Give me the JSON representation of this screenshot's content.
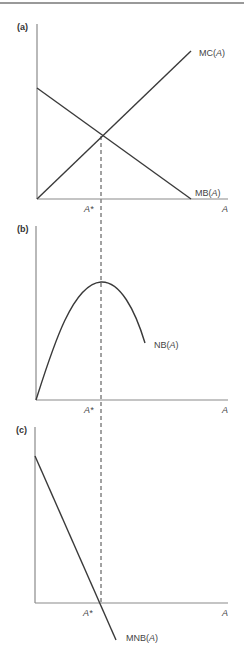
{
  "figure": {
    "panels": [
      {
        "id": "a",
        "label": "(a)",
        "x_axis_label": "A",
        "x_tick_label": "A*",
        "curves": [
          {
            "name": "MC",
            "arg": "A",
            "label_prefix": "MC(",
            "label_var": "A",
            "label_suffix": ")"
          },
          {
            "name": "MB",
            "arg": "A",
            "label_prefix": "MB(",
            "label_var": "A",
            "label_suffix": ")"
          }
        ]
      },
      {
        "id": "b",
        "label": "(b)",
        "x_axis_label": "A",
        "x_tick_label": "A*",
        "curves": [
          {
            "name": "NB",
            "arg": "A",
            "label_prefix": "NB(",
            "label_var": "A",
            "label_suffix": ")"
          }
        ]
      },
      {
        "id": "c",
        "label": "(c)",
        "x_axis_label": "A",
        "x_tick_label": "A*",
        "curves": [
          {
            "name": "MNB",
            "arg": "A",
            "label_prefix": "MNB(",
            "label_var": "A",
            "label_suffix": ")"
          }
        ]
      }
    ],
    "colors": {
      "axis": "#8a8a8a",
      "curve": "#3a3a3a",
      "text": "#444444",
      "background": "#ffffff"
    }
  }
}
